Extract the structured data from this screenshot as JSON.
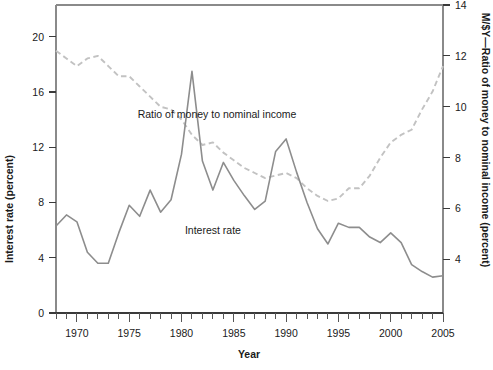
{
  "chart_data": {
    "type": "line",
    "title": "",
    "subtitle": "",
    "xlabel": "Year",
    "ylabel": "Interest rate (percent)",
    "y2label": "M/$Y—Ratio of money to nominal income (percent)",
    "xlim": [
      1968,
      2005
    ],
    "ylim": [
      0,
      22.3
    ],
    "y2lim": [
      1.9,
      14.0
    ],
    "grid": false,
    "legend_position": "inline-annotations",
    "x_tick_labels": [
      "1970",
      "1975",
      "1980",
      "1985",
      "1990",
      "1995",
      "2000",
      "2005"
    ],
    "x_tick_values": [
      1970,
      1975,
      1980,
      1985,
      1990,
      1995,
      2000,
      2005
    ],
    "x_minor_ticks_every": 1,
    "y_tick_labels": [
      "0",
      "4",
      "8",
      "12",
      "16",
      "20"
    ],
    "y_tick_values": [
      0,
      4,
      8,
      12,
      16,
      20
    ],
    "y2_tick_labels": [
      "4",
      "6",
      "8",
      "10",
      "12",
      "14"
    ],
    "y2_tick_values": [
      4,
      6,
      8,
      10,
      12,
      14
    ],
    "annotations": [
      {
        "name": "ratio-series-label",
        "text": "Ratio of money to nominal income",
        "x": 1983.4,
        "y_axis": "right",
        "y": 9.55
      },
      {
        "name": "interest-series-label",
        "text": "Interest rate",
        "x": 1983.0,
        "y_axis": "left",
        "y": 5.7
      }
    ],
    "series": [
      {
        "name": "Interest rate",
        "axis": "left",
        "style": "solid",
        "color": "#8d8d8d",
        "x": [
          1968,
          1969,
          1970,
          1971,
          1972,
          1973,
          1974,
          1975,
          1976,
          1977,
          1978,
          1979,
          1980,
          1981,
          1982,
          1983,
          1984,
          1985,
          1986,
          1987,
          1988,
          1989,
          1990,
          1991,
          1992,
          1993,
          1994,
          1995,
          1996,
          1997,
          1998,
          1999,
          2000,
          2001,
          2002,
          2003,
          2004,
          2005
        ],
        "values": [
          6.3,
          7.1,
          6.6,
          4.4,
          3.6,
          3.6,
          5.8,
          7.8,
          7.0,
          8.9,
          7.3,
          8.2,
          11.5,
          17.5,
          11.0,
          8.9,
          10.9,
          9.6,
          8.5,
          7.5,
          8.1,
          11.7,
          12.6,
          10.2,
          8.0,
          6.1,
          5.0,
          6.5,
          6.2,
          6.2,
          5.5,
          5.1,
          5.8,
          5.1,
          3.5,
          3.0,
          2.6,
          2.7
        ]
      },
      {
        "name": "Ratio of money to nominal income",
        "axis": "right",
        "style": "dashed",
        "color": "#c2c2c2",
        "x": [
          1968,
          1969,
          1970,
          1971,
          1972,
          1973,
          1974,
          1975,
          1976,
          1977,
          1978,
          1979,
          1980,
          1981,
          1982,
          1983,
          1984,
          1985,
          1986,
          1987,
          1988,
          1989,
          1990,
          1991,
          1992,
          1993,
          1994,
          1995,
          1996,
          1997,
          1998,
          1999,
          2000,
          2001,
          2002,
          2003,
          2004,
          2005
        ],
        "values": [
          12.2,
          11.9,
          11.6,
          11.9,
          12.0,
          11.6,
          11.2,
          11.2,
          10.8,
          10.4,
          10.0,
          9.9,
          9.5,
          8.9,
          8.5,
          8.6,
          8.2,
          7.9,
          7.6,
          7.4,
          7.2,
          7.3,
          7.4,
          7.2,
          6.8,
          6.5,
          6.3,
          6.4,
          6.8,
          6.8,
          7.3,
          8.0,
          8.6,
          8.9,
          9.1,
          9.9,
          10.6,
          11.6
        ]
      }
    ]
  },
  "layout": {
    "plot_left": 56,
    "plot_right": 443,
    "plot_top": 5,
    "plot_bottom": 313
  },
  "colors": {
    "interest_rate_line": "#8d8d8d",
    "ratio_line": "#c2c2c2",
    "axis": "#3a3a3a",
    "text": "#1a1a1a",
    "background": "#ffffff"
  }
}
